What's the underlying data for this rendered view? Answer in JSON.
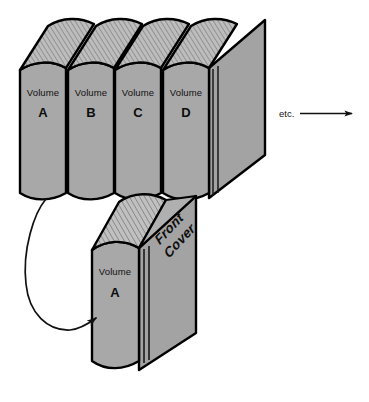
{
  "colors": {
    "book_face": "#a8a8a8",
    "book_top": "#b4b4b4",
    "book_cover_side": "#a0a0a0",
    "outline": "#000000",
    "page_lines": "#555555",
    "background": "#ffffff",
    "text": "#111111"
  },
  "shelf_row": {
    "label_prefix": "Volume",
    "books": [
      {
        "volume_word": "Volume",
        "letter": "A"
      },
      {
        "volume_word": "Volume",
        "letter": "B"
      },
      {
        "volume_word": "Volume",
        "letter": "C"
      },
      {
        "volume_word": "Volume",
        "letter": "D"
      }
    ],
    "continuation": {
      "label": "etc.",
      "arrow": "right-arrow"
    }
  },
  "front_book": {
    "volume_word": "Volume",
    "letter": "A",
    "cover_label_line1": "Front",
    "cover_label_line2": "Cover"
  },
  "callout": {
    "arrow_name": "curved-pointer-arrow",
    "from": "Volume A in row",
    "to": "Front book spine"
  },
  "icons": {
    "etc_arrow": "arrow-right-icon",
    "callout_arrow": "curved-arrow-icon"
  }
}
